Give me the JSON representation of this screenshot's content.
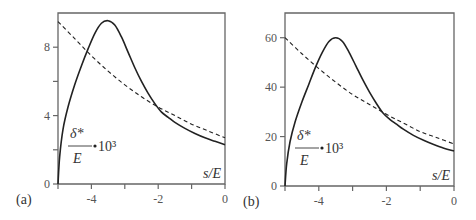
{
  "chart_data": [
    {
      "type": "line",
      "panel_label": "(a)",
      "xlabel": "s/E",
      "ylabel": "δ*/E · 10³",
      "ylabel_parts": {
        "numerator": "δ*",
        "denominator": "E",
        "factor": "10³"
      },
      "xlim": [
        -5,
        0
      ],
      "ylim": [
        0,
        10
      ],
      "xticks": [
        -5,
        -4,
        -3,
        -2,
        -1,
        0
      ],
      "xtick_labels": [
        "",
        "-4",
        "",
        "-2",
        "",
        "0"
      ],
      "yticks": [
        0,
        2,
        4,
        6,
        8
      ],
      "ytick_labels": [
        "0",
        "",
        "4",
        "",
        "8"
      ],
      "series": [
        {
          "name": "solid",
          "style": "solid",
          "x": [
            -5.0,
            -4.95,
            -4.85,
            -4.7,
            -4.5,
            -4.3,
            -4.1,
            -3.9,
            -3.7,
            -3.5,
            -3.3,
            -3.1,
            -2.9,
            -2.7,
            -2.5,
            -2.3,
            -2.1,
            -1.9,
            -1.7,
            -1.5,
            -1.2,
            -0.9,
            -0.6,
            -0.3,
            0.0
          ],
          "y": [
            0.0,
            1.6,
            3.2,
            4.5,
            5.8,
            6.9,
            7.9,
            8.8,
            9.4,
            9.55,
            9.3,
            8.6,
            7.7,
            6.8,
            6.0,
            5.3,
            4.7,
            4.2,
            3.9,
            3.6,
            3.25,
            2.95,
            2.7,
            2.5,
            2.3
          ]
        },
        {
          "name": "dashed",
          "style": "dashed",
          "x": [
            -5.0,
            -4.5,
            -4.0,
            -3.5,
            -3.0,
            -2.5,
            -2.0,
            -1.5,
            -1.0,
            -0.5,
            0.0
          ],
          "y": [
            9.5,
            8.5,
            7.5,
            6.6,
            5.8,
            5.1,
            4.5,
            4.0,
            3.5,
            3.1,
            2.7
          ]
        }
      ]
    },
    {
      "type": "line",
      "panel_label": "(b)",
      "xlabel": "s/E",
      "ylabel": "δ*/E · 10³",
      "ylabel_parts": {
        "numerator": "δ*",
        "denominator": "E",
        "factor": "10³"
      },
      "xlim": [
        -5,
        0
      ],
      "ylim": [
        0,
        70
      ],
      "xticks": [
        -5,
        -4,
        -3,
        -2,
        -1,
        0
      ],
      "xtick_labels": [
        "",
        "-4",
        "",
        "-2",
        "",
        "0"
      ],
      "yticks": [
        0,
        20,
        40,
        60
      ],
      "ytick_labels": [
        "0",
        "20",
        "40",
        "60"
      ],
      "series": [
        {
          "name": "solid",
          "style": "solid",
          "x": [
            -5.0,
            -4.95,
            -4.85,
            -4.7,
            -4.5,
            -4.3,
            -4.1,
            -3.9,
            -3.7,
            -3.5,
            -3.3,
            -3.1,
            -2.9,
            -2.7,
            -2.5,
            -2.3,
            -2.1,
            -1.9,
            -1.7,
            -1.5,
            -1.2,
            -0.9,
            -0.6,
            -0.3,
            0.0
          ],
          "y": [
            0.0,
            9,
            18,
            26,
            34,
            41,
            48,
            54,
            58.5,
            60,
            58.5,
            54,
            48.5,
            43,
            38,
            33.5,
            29.5,
            27,
            25,
            23,
            20.5,
            18.5,
            16.8,
            15.3,
            14.2
          ]
        },
        {
          "name": "dashed",
          "style": "dashed",
          "x": [
            -5.0,
            -4.5,
            -4.0,
            -3.5,
            -3.0,
            -2.5,
            -2.0,
            -1.5,
            -1.0,
            -0.5,
            0.0
          ],
          "y": [
            60,
            53.5,
            47.5,
            42,
            37,
            33,
            29,
            25.5,
            22,
            19.5,
            17
          ]
        }
      ]
    }
  ]
}
